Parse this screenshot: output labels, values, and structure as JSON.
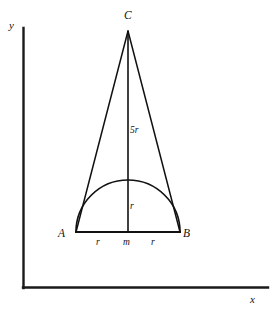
{
  "figure": {
    "type": "geometry-diagram",
    "background_color": "#ffffff",
    "stroke_color": "#111111",
    "axes": {
      "y_label": "y",
      "x_label": "x",
      "origin_px": [
        23,
        288
      ],
      "y_axis_top_px": [
        23,
        28
      ],
      "x_axis_right_px": [
        268,
        288
      ]
    },
    "vertices": [
      {
        "id": "C",
        "label": "C",
        "px": [
          128,
          31
        ],
        "label_px": [
          124,
          11
        ]
      },
      {
        "id": "A",
        "label": "A",
        "px": [
          76,
          232
        ],
        "label_px": [
          58,
          229
        ]
      },
      {
        "id": "B",
        "label": "B",
        "px": [
          180,
          232
        ],
        "label_px": [
          183,
          229
        ]
      },
      {
        "id": "m",
        "label": "m",
        "px": [
          128,
          232
        ],
        "label_px": [
          123,
          238
        ]
      }
    ],
    "segment_labels": [
      {
        "id": "height",
        "label": "5r",
        "label_px": [
          130,
          126
        ]
      },
      {
        "id": "radius",
        "label": "r",
        "label_px": [
          130,
          202
        ]
      },
      {
        "id": "half-base-left",
        "label": "r",
        "label_px": [
          96,
          238
        ]
      },
      {
        "id": "half-base-right",
        "label": "r",
        "label_px": [
          151,
          238
        ]
      }
    ],
    "semicircle": {
      "center_px": [
        128,
        232
      ],
      "radius_px": 52,
      "apex_px": [
        128,
        180
      ]
    }
  }
}
